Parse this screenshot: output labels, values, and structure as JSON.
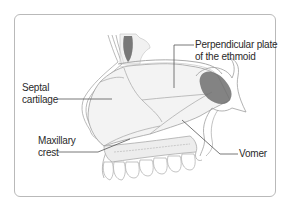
{
  "figure": {
    "labels": {
      "perpendicular_plate_line1": "Perpendicular plate",
      "perpendicular_plate_line2": "of the ethmoid",
      "septal_cartilage_line1": "Septal",
      "septal_cartilage_line2": "cartilage",
      "maxillary_crest_line1": "Maxillary",
      "maxillary_crest_line2": "crest",
      "vomer": "Vomer"
    }
  },
  "colors": {
    "frame_border": "#b9b9b9",
    "outline": "#9a9a9a",
    "leader_line": "#555555",
    "bone_fill": "#f2f2f2",
    "sinus_fill": "#6f6f6f",
    "text": "#2a2a2a"
  }
}
